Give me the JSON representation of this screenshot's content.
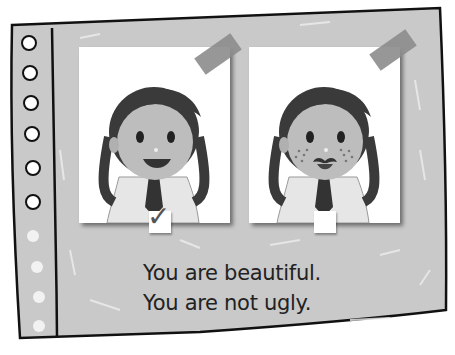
{
  "pictures": [
    {
      "label": "girl-smiling",
      "checked": true
    },
    {
      "label": "girl-freckles-mustache",
      "checked": false
    }
  ],
  "check_glyph": "✓",
  "caption": {
    "line1": "You are beautiful.",
    "line2": "You are not ugly."
  },
  "colors": {
    "board": "#c8c8c8",
    "outline": "#111111",
    "hair": "#3a3a3a",
    "skin": "#bdbdbd"
  }
}
